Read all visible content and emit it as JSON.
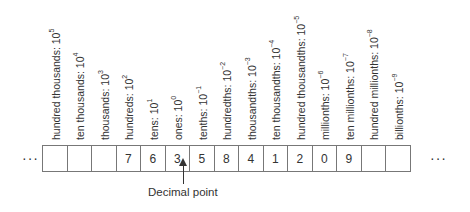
{
  "diagram": {
    "left_ellipsis": "···",
    "right_ellipsis": "···",
    "decimal_point_caption": "Decimal point",
    "columns": [
      {
        "name": "hundred thousands",
        "base": "10",
        "exp": "5",
        "digit": ""
      },
      {
        "name": "ten thousands",
        "base": "10",
        "exp": "4",
        "digit": ""
      },
      {
        "name": "thousands",
        "base": "10",
        "exp": "3",
        "digit": ""
      },
      {
        "name": "hundreds",
        "base": "10",
        "exp": "2",
        "digit": "7"
      },
      {
        "name": "tens",
        "base": "10",
        "exp": "1",
        "digit": "6"
      },
      {
        "name": "ones",
        "base": "10",
        "exp": "0",
        "digit": "3"
      },
      {
        "name": "tenths",
        "base": "10",
        "exp": "−1",
        "digit": "5"
      },
      {
        "name": "hundredths",
        "base": "10",
        "exp": "−2",
        "digit": "8"
      },
      {
        "name": "thousandths",
        "base": "10",
        "exp": "−3",
        "digit": "4"
      },
      {
        "name": "ten thousandths",
        "base": "10",
        "exp": "−4",
        "digit": "1"
      },
      {
        "name": "hundred thousandths",
        "base": "10",
        "exp": "−5",
        "digit": "2"
      },
      {
        "name": "millionths",
        "base": "10",
        "exp": "−6",
        "digit": "0"
      },
      {
        "name": "ten millionths",
        "base": "10",
        "exp": "−7",
        "digit": "9"
      },
      {
        "name": "hundred millionths",
        "base": "10",
        "exp": "−8",
        "digit": ""
      },
      {
        "name": "billionths",
        "base": "10",
        "exp": "−9",
        "digit": ""
      }
    ]
  }
}
